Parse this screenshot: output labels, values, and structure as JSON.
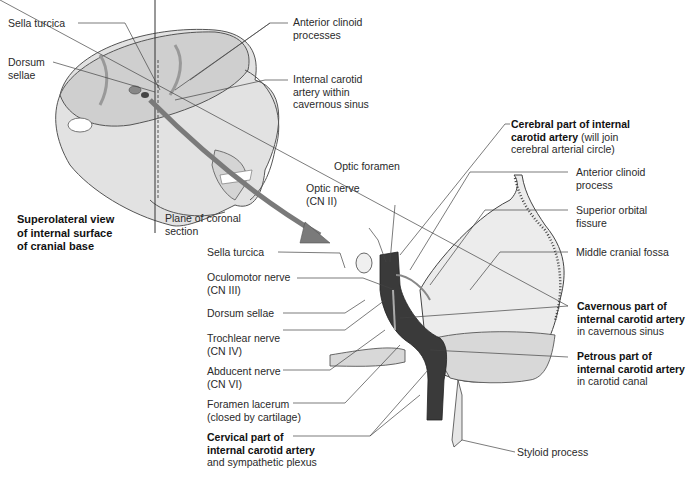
{
  "top_view": {
    "labels": {
      "sella_turcica": "Sella turcica",
      "dorsum_sellae_1": "Dorsum",
      "dorsum_sellae_2": "sellae",
      "anterior_clinoid_1": "Anterior clinoid",
      "anterior_clinoid_2": "processes",
      "ica_cav_1": "Internal carotid",
      "ica_cav_2": "artery within",
      "ica_cav_3": "cavernous sinus",
      "caption_1": "Superolateral view",
      "caption_2": "of internal surface",
      "caption_3": "of cranial base",
      "plane_1": "Plane of coronal",
      "plane_2": "section"
    }
  },
  "coronal_view": {
    "labels": {
      "optic_foramen": "Optic foramen",
      "optic_nerve_1": "Optic nerve",
      "optic_nerve_2": "(CN II)",
      "sella_turcica": "Sella turcica",
      "oculomotor_1": "Oculomotor nerve",
      "oculomotor_2": "(CN III)",
      "dorsum_sellae": "Dorsum sellae",
      "trochlear_1": "Trochlear nerve",
      "trochlear_2": "(CN IV)",
      "abducent_1": "Abducent nerve",
      "abducent_2": "(CN VI)",
      "foramen_lacerum_1": "Foramen lacerum",
      "foramen_lacerum_2": "(closed by cartilage)",
      "cervical_1": "Cervical part of",
      "cervical_2": "internal carotid artery",
      "cervical_3": "and sympathetic plexus",
      "cerebral_1": "Cerebral part of internal",
      "cerebral_2_bold": "carotid artery",
      "cerebral_2_rest": " (will join",
      "cerebral_3": "cerebral arterial circle)",
      "ant_clinoid_1": "Anterior clinoid",
      "ant_clinoid_2": "process",
      "sup_orbital_1": "Superior orbital",
      "sup_orbital_2": "fissure",
      "middle_fossa": "Middle cranial fossa",
      "cavernous_1": "Cavernous part of",
      "cavernous_2": "internal carotid artery",
      "cavernous_3": "in cavernous sinus",
      "petrous_1": "Petrous part of",
      "petrous_2": "internal carotid artery",
      "petrous_3": "in carotid canal",
      "styloid": "Styloid process"
    }
  },
  "colors": {
    "bone_fill": "#e2e2e2",
    "bone_shadow": "#b8b8b8",
    "artery": "#3a3a3a",
    "arrow": "#7a7a7a",
    "leader": "#444444"
  }
}
